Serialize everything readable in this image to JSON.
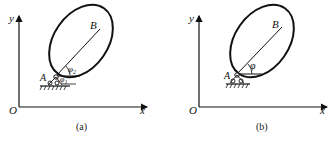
{
  "panels": [
    {
      "id": "a",
      "caption": "(a)",
      "axis_labels": {
        "origin": "O",
        "x": "x",
        "y": "y"
      },
      "points": {
        "pivot": "A",
        "end": "B"
      },
      "angles": [
        {
          "symbol": "φ",
          "subscript": "2"
        },
        {
          "symbol": "φ",
          "subscript": "1"
        }
      ]
    },
    {
      "id": "b",
      "caption": "(b)",
      "axis_labels": {
        "origin": "O",
        "x": "x",
        "y": "y"
      },
      "points": {
        "pivot": "A",
        "end": "B"
      },
      "angles": [
        {
          "symbol": "φ",
          "subscript": ""
        }
      ]
    }
  ],
  "colors": {
    "stroke": "#111111",
    "background": "#ffffff"
  }
}
